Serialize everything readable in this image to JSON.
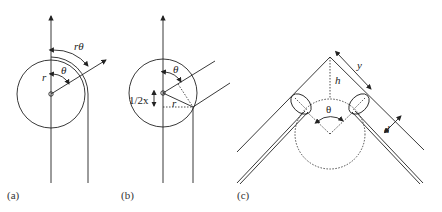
{
  "figure": {
    "panels": [
      {
        "id": "a",
        "caption": "(a)",
        "labels": {
          "arc": "rθ",
          "angle": "θ",
          "radius": "r"
        }
      },
      {
        "id": "b",
        "caption": "(b)",
        "labels": {
          "angle": "θ",
          "offset": "1/2x",
          "radius": "r"
        }
      },
      {
        "id": "c",
        "caption": "(c)",
        "labels": {
          "length": "y",
          "height": "h",
          "angle": "θ",
          "width": "d"
        }
      }
    ]
  }
}
